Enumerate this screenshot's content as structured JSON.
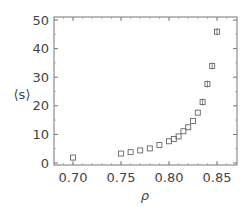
{
  "chart_data": {
    "type": "scatter",
    "title": "",
    "xlabel": "ρ",
    "ylabel": "⟨s⟩",
    "xlim": [
      0.68,
      0.87
    ],
    "ylim": [
      0,
      50
    ],
    "xticks": [
      0.7,
      0.75,
      0.8,
      0.85
    ],
    "xtick_labels": [
      "0.70",
      "0.75",
      "0.80",
      "0.85"
    ],
    "yticks": [
      0,
      10,
      20,
      30,
      40,
      50
    ],
    "ytick_labels": [
      "0",
      "10",
      "20",
      "30",
      "40",
      "50"
    ],
    "grid": false,
    "legend": null,
    "marker": "open-square",
    "marker_color": "#666666",
    "series": [
      {
        "name": "⟨s⟩",
        "x": [
          0.7,
          0.75,
          0.76,
          0.77,
          0.78,
          0.79,
          0.8,
          0.805,
          0.81,
          0.815,
          0.82,
          0.825,
          0.83,
          0.835,
          0.84,
          0.845,
          0.85
        ],
        "y": [
          1.9,
          3.3,
          3.8,
          4.4,
          5.1,
          6.3,
          7.6,
          8.4,
          9.3,
          11.1,
          12.5,
          14.7,
          17.6,
          21.3,
          27.6,
          33.9,
          45.9
        ],
        "error_bars": true
      }
    ]
  }
}
